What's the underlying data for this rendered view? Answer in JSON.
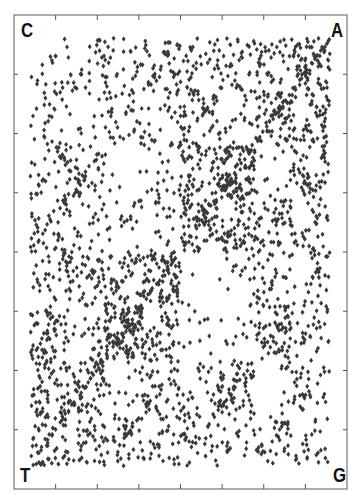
{
  "chart_data": {
    "type": "scatter",
    "title": "",
    "corners": {
      "top_left": "C",
      "top_right": "A",
      "bottom_left": "T",
      "bottom_right": "G"
    },
    "xlabel": "",
    "ylabel": "",
    "xlim": [
      0,
      1
    ],
    "ylim": [
      0,
      1
    ],
    "x_ticks": [
      0.125,
      0.25,
      0.375,
      0.5,
      0.625,
      0.75,
      0.875
    ],
    "y_ticks": [
      0.125,
      0.25,
      0.375,
      0.5,
      0.625,
      0.75,
      0.875
    ],
    "tick_labels": [],
    "grid": false,
    "legend": null,
    "marker": "diamond",
    "marker_color": "#3a3a3a",
    "frame_color": "#777777",
    "point_count_estimate": 2600,
    "notable_features": [
      "dense diagonal band from T (bottom-left) to A (top-right)",
      "sparse voids near quadrant centers",
      "denser region toward T corner"
    ],
    "base_weights": {
      "A": 0.3,
      "T": 0.3,
      "C": 0.2,
      "G": 0.2
    }
  },
  "labels": {
    "c": "C",
    "a": "A",
    "t": "T",
    "g": "G"
  }
}
